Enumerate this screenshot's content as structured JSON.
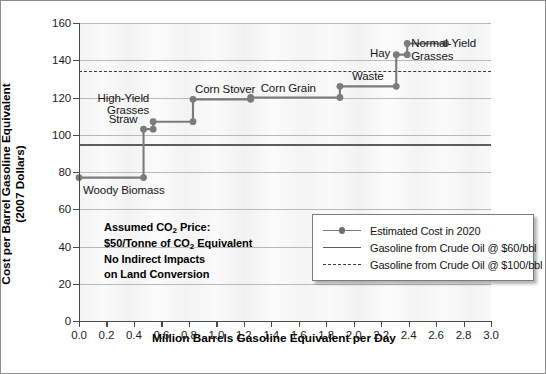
{
  "chart_data": {
    "type": "line",
    "title": "",
    "xlabel": "Million Barrels Gasoline Equivalent per Day",
    "ylabel": "Cost per Barrel Gasoline Equivalent\n(2007 Dollars)",
    "xlim": [
      0.0,
      3.0
    ],
    "ylim": [
      0,
      160
    ],
    "xticks": [
      "0.0",
      "0.2",
      "0.4",
      "0.6",
      "0.8",
      "1.0",
      "1.2",
      "1.4",
      "1.6",
      "1.8",
      "2.0",
      "2.2",
      "2.4",
      "2.6",
      "2.8",
      "3.0"
    ],
    "xtick_values": [
      0.0,
      0.2,
      0.4,
      0.6,
      0.8,
      1.0,
      1.2,
      1.4,
      1.6,
      1.8,
      2.0,
      2.2,
      2.4,
      2.6,
      2.8,
      3.0
    ],
    "yticks": [
      "0",
      "20",
      "40",
      "60",
      "80",
      "100",
      "120",
      "140",
      "160"
    ],
    "ytick_values": [
      0,
      20,
      40,
      60,
      80,
      100,
      120,
      140,
      160
    ],
    "grid": "horizontal",
    "legend_position": "bottom-right",
    "series": [
      {
        "name": "Estimated Cost in 2020",
        "style": "step-with-markers",
        "color": "#7b7b7b",
        "steps": [
          {
            "label": "Woody Biomass",
            "x_start": 0.0,
            "x_end": 0.47,
            "cost": 77
          },
          {
            "label": "Straw",
            "x_start": 0.47,
            "x_end": 0.54,
            "cost": 103
          },
          {
            "label": "High-Yield\nGrasses",
            "x_start": 0.54,
            "x_end": 0.83,
            "cost": 107
          },
          {
            "label": "Corn Stover",
            "x_start": 0.83,
            "x_end": 1.25,
            "cost": 119
          },
          {
            "label": "Corn Grain",
            "x_start": 1.25,
            "x_end": 1.9,
            "cost": 120
          },
          {
            "label": "Waste",
            "x_start": 1.9,
            "x_end": 2.31,
            "cost": 126
          },
          {
            "label": "Hay",
            "x_start": 2.31,
            "x_end": 2.39,
            "cost": 143
          },
          {
            "label": "Normal-Yield\nGrasses",
            "x_start": 2.39,
            "x_end": 2.67,
            "cost": 149
          }
        ]
      }
    ],
    "reference_lines": [
      {
        "name": "Gasoline from Crude Oil @ $60/bbl",
        "value": 95,
        "style": "solid",
        "color": "#5d5d5d"
      },
      {
        "name": "Gasoline from Crude Oil @ $100/bbl",
        "value": 134,
        "style": "dashed",
        "color": "#3c3c3c"
      }
    ],
    "annotations": [
      "Assumed CO₂ Price:",
      "$50/Tonne of CO₂ Equivalent",
      "No Indirect Impacts",
      "on Land Conversion"
    ]
  },
  "axes": {
    "x_title": "Million Barrels Gasoline Equivalent per Day",
    "y_title": "Cost per Barrel Gasoline Equivalent\n(2007 Dollars)"
  },
  "legend": {
    "items": [
      {
        "label": "Estimated Cost in 2020",
        "key": "line-marker"
      },
      {
        "label": "Gasoline from Crude Oil @ $60/bbl",
        "key": "line-solid"
      },
      {
        "label": "Gasoline from Crude Oil @ $100/bbl",
        "key": "line-dashed"
      }
    ]
  },
  "assumptions": {
    "line1_pre": "Assumed CO",
    "line1_sub": "2",
    "line1_post": " Price:",
    "line2_pre": "$50/Tonne of CO",
    "line2_sub": "2",
    "line2_post": " Equivalent",
    "line3": "No Indirect Impacts",
    "line4": "on Land Conversion"
  }
}
